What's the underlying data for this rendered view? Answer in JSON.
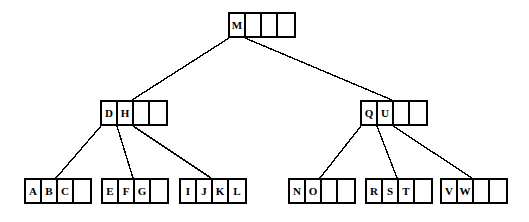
{
  "diagram": {
    "type": "b-tree",
    "width": 529,
    "height": 222,
    "background_color": "#ffffff",
    "line_color": "#000000",
    "node_border_color": "#000000",
    "node_fill_color": "#ffffff",
    "cell_width": 16,
    "cell_height": 26,
    "keys_per_node": 4,
    "levels": 3,
    "nodes": [
      {
        "id": "root",
        "level": 0,
        "x": 228,
        "y": 12,
        "keys": [
          "M",
          "",
          "",
          ""
        ],
        "filled": 1
      },
      {
        "id": "internal-left",
        "level": 1,
        "x": 100,
        "y": 100,
        "keys": [
          "D",
          "H",
          "",
          ""
        ],
        "filled": 2
      },
      {
        "id": "internal-right",
        "level": 1,
        "x": 360,
        "y": 100,
        "keys": [
          "Q",
          "U",
          "",
          ""
        ],
        "filled": 2
      },
      {
        "id": "leaf-abc",
        "level": 2,
        "x": 24,
        "y": 178,
        "keys": [
          "A",
          "B",
          "C",
          ""
        ],
        "filled": 3
      },
      {
        "id": "leaf-efg",
        "level": 2,
        "x": 101,
        "y": 178,
        "keys": [
          "E",
          "F",
          "G",
          ""
        ],
        "filled": 3
      },
      {
        "id": "leaf-ijkl",
        "level": 2,
        "x": 179,
        "y": 178,
        "keys": [
          "I",
          "J",
          "K",
          "L"
        ],
        "filled": 4
      },
      {
        "id": "leaf-no",
        "level": 2,
        "x": 288,
        "y": 178,
        "keys": [
          "N",
          "O",
          "",
          ""
        ],
        "filled": 2
      },
      {
        "id": "leaf-rst",
        "level": 2,
        "x": 365,
        "y": 178,
        "keys": [
          "R",
          "S",
          "T",
          ""
        ],
        "filled": 3
      },
      {
        "id": "leaf-vw",
        "level": 2,
        "x": 440,
        "y": 178,
        "keys": [
          "V",
          "W",
          "",
          ""
        ],
        "filled": 2
      }
    ],
    "edges": [
      {
        "id": "edge-root-left",
        "from": "root",
        "to": "internal-left",
        "x1": 229,
        "y1": 38,
        "x2": 132,
        "y2": 100
      },
      {
        "id": "edge-root-right",
        "from": "root",
        "to": "internal-right",
        "x1": 245,
        "y1": 38,
        "x2": 392,
        "y2": 100
      },
      {
        "id": "edge-left-1",
        "from": "internal-left",
        "to": "leaf-abc",
        "x1": 101,
        "y1": 126,
        "x2": 56,
        "y2": 178
      },
      {
        "id": "edge-left-2",
        "from": "internal-left",
        "to": "leaf-efg",
        "x1": 117,
        "y1": 126,
        "x2": 133,
        "y2": 178
      },
      {
        "id": "edge-left-3",
        "from": "internal-left",
        "to": "leaf-ijkl",
        "x1": 133,
        "y1": 126,
        "x2": 211,
        "y2": 178
      },
      {
        "id": "edge-right-1",
        "from": "internal-right",
        "to": "leaf-no",
        "x1": 361,
        "y1": 126,
        "x2": 320,
        "y2": 178
      },
      {
        "id": "edge-right-2",
        "from": "internal-right",
        "to": "leaf-rst",
        "x1": 377,
        "y1": 126,
        "x2": 397,
        "y2": 178
      },
      {
        "id": "edge-right-3",
        "from": "internal-right",
        "to": "leaf-vw",
        "x1": 393,
        "y1": 126,
        "x2": 472,
        "y2": 178
      }
    ]
  }
}
